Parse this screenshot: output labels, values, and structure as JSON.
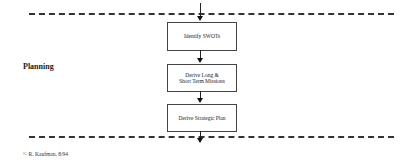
{
  "diagram": {
    "section_label": "Planning",
    "boxes": [
      {
        "label": "Identify SWOTs"
      },
      {
        "label": "Derive Long &\nShort Term Missions"
      },
      {
        "label": "Derive Strategic Plan"
      }
    ],
    "credit": "© R. Kaufman, 8/94"
  }
}
